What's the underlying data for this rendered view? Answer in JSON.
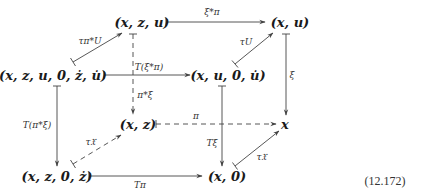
{
  "diagram": {
    "type": "commutative-diagram",
    "nodes": {
      "xzu": "(x, z, u)",
      "xu": "(x, u)",
      "xzu0zu": "(x, z, u, 0, ż, u̇)",
      "xu0u": "(x, u, 0, u̇)",
      "xz": "(x, z)",
      "x": "x",
      "xz0z": "(x, z, 0, ż)",
      "x0": "(x, 0)"
    },
    "arrows": {
      "xzu_to_xu": "ξ*π",
      "xzu0zu_to_xzu": "τ_{π*U}",
      "xu0u_to_xu": "τ_U",
      "xu_to_x": "ξ",
      "xzu0zu_to_xu0u": "T(ξ*π)",
      "xzu_to_xz": "π*ξ",
      "xzu0zu_to_xz0z": "T(π*ξ)",
      "xz0z_to_xz": "τ_X",
      "xz_to_x": "π",
      "xu0u_to_x0": "Tξ",
      "x0_to_x": "τ_X",
      "xz0z_to_x0": "Tπ"
    },
    "equation_number": "(12.172)"
  },
  "labels": {
    "tau_piU": "τπ*U",
    "tau_U": "τU",
    "tau_X_left": "τ𝔛",
    "tau_X_right": "τ𝔛"
  }
}
